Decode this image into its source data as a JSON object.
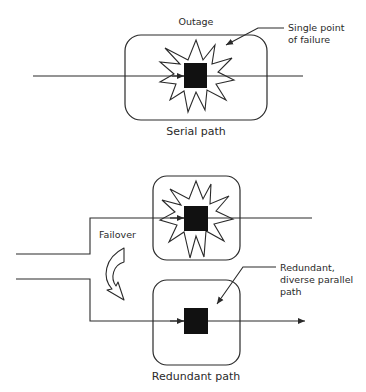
{
  "diagram": {
    "top": {
      "outage_label": "Outage",
      "callout_label": "Single point\nof failure",
      "box_label": "Serial path"
    },
    "bottom": {
      "failover_label": "Failover",
      "callout_label": "Redundant,\ndiverse parallel\npath",
      "box_label": "Redundant path"
    },
    "colors": {
      "stroke": "#2a2a2a",
      "fill_block": "#111111",
      "background": "#ffffff"
    }
  }
}
